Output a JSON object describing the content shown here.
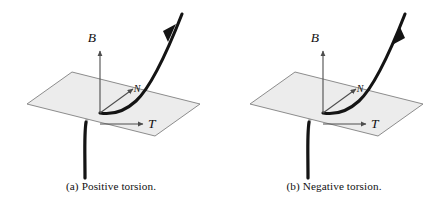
{
  "figure": {
    "background_color": "#ffffff",
    "panel_count": 2
  },
  "style": {
    "plane_fill": "#ececec",
    "plane_stroke": "#808080",
    "curve_color": "#141414",
    "curve_hidden_color": "#b0b0b0",
    "vector_color": "#4d4d4d",
    "label_color": "#111111",
    "caption_color": "#111111"
  },
  "panels": [
    {
      "id": "panel-a",
      "caption_tag": "(a)",
      "caption_text": "Positive torsion.",
      "caption_full": "(a) Positive torsion.",
      "curve_direction": "outgoing-up-right",
      "arrowhead_label": "arrow-up-right",
      "vectors": [
        {
          "name": "binormal",
          "label": "B⃗",
          "symbol": "B",
          "direction": "up"
        },
        {
          "name": "normal",
          "label": "N⃗",
          "symbol": "N",
          "direction": "up-right"
        },
        {
          "name": "tangent",
          "label": "T⃗",
          "symbol": "T",
          "direction": "right"
        }
      ],
      "plane_name": "osculating-plane"
    },
    {
      "id": "panel-b",
      "caption_tag": "(b)",
      "caption_text": "Negative torsion.",
      "caption_full": "(b) Negative torsion.",
      "curve_direction": "incoming-down-left",
      "arrowhead_label": "arrow-down-left",
      "vectors": [
        {
          "name": "binormal",
          "label": "B⃗",
          "symbol": "B",
          "direction": "up"
        },
        {
          "name": "normal",
          "label": "N⃗",
          "symbol": "N",
          "direction": "up-right"
        },
        {
          "name": "tangent",
          "label": "T⃗",
          "symbol": "T",
          "direction": "right"
        }
      ],
      "plane_name": "osculating-plane"
    }
  ]
}
